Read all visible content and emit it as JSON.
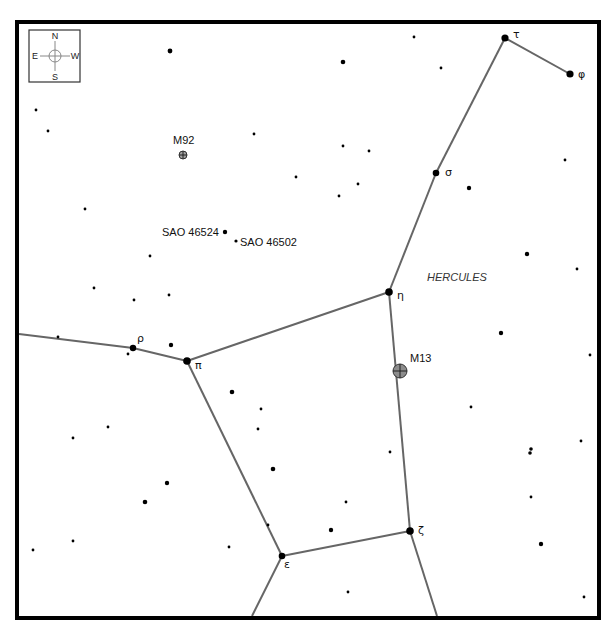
{
  "map": {
    "width": 612,
    "height": 632,
    "frame": {
      "x": 17,
      "y": 22,
      "w": 582,
      "h": 596
    },
    "constellation_name": {
      "text": "HERCULES",
      "x": 427,
      "y": 281
    },
    "compass": {
      "box": {
        "x": 29,
        "y": 30,
        "w": 51,
        "h": 52
      },
      "center": {
        "x": 55,
        "y": 56
      },
      "labels": {
        "north": "N",
        "south": "S",
        "east": "E",
        "west": "W"
      }
    },
    "colors": {
      "line": "#666666",
      "star": "#000000",
      "dso_m13": "#8c8c8c",
      "dso_m92": "#a0a0a0",
      "frame": "#000000"
    },
    "named_stars": [
      {
        "id": "tau",
        "label": "τ",
        "x": 505,
        "y": 38,
        "r": 3.6,
        "lx": 513,
        "ly": 38
      },
      {
        "id": "phi",
        "label": "φ",
        "x": 570,
        "y": 74,
        "r": 3.6,
        "lx": 578,
        "ly": 78
      },
      {
        "id": "sigma",
        "label": "σ",
        "x": 436,
        "y": 173,
        "r": 3.3,
        "lx": 445,
        "ly": 176
      },
      {
        "id": "eta",
        "label": "η",
        "x": 389,
        "y": 292,
        "r": 3.8,
        "lx": 397,
        "ly": 299
      },
      {
        "id": "pi",
        "label": "π",
        "x": 187,
        "y": 361,
        "r": 3.8,
        "lx": 195,
        "ly": 369
      },
      {
        "id": "rho",
        "label": "ρ",
        "x": 133,
        "y": 348,
        "r": 3.2,
        "lx": 137,
        "ly": 342
      },
      {
        "id": "epsilon",
        "label": "ε",
        "x": 282,
        "y": 556,
        "r": 3.3,
        "lx": 284,
        "ly": 568
      },
      {
        "id": "zeta",
        "label": "ζ",
        "x": 410,
        "y": 531,
        "r": 3.8,
        "lx": 418,
        "ly": 534
      }
    ],
    "labeled_stars": [
      {
        "label": "SAO 46524",
        "x": 225,
        "y": 232,
        "r": 2.2,
        "lx": 162,
        "ly": 236,
        "anchor": "start"
      },
      {
        "label": "SAO 46502",
        "x": 236,
        "y": 241,
        "r": 1.6,
        "lx": 240,
        "ly": 246,
        "anchor": "start"
      }
    ],
    "deep_sky_objects": [
      {
        "label": "M92",
        "x": 183,
        "y": 155,
        "r": 4,
        "fill": "#a0a0a0",
        "lx": 173,
        "ly": 144
      },
      {
        "label": "M13",
        "x": 400,
        "y": 371,
        "r": 7,
        "fill": "#8c8c8c",
        "lx": 410,
        "ly": 362
      }
    ],
    "lines": [
      {
        "from": "tau",
        "to": "phi",
        "x1": 505,
        "y1": 38,
        "x2": 570,
        "y2": 74
      },
      {
        "from": "tau",
        "to": "sigma",
        "x1": 505,
        "y1": 38,
        "x2": 436,
        "y2": 173
      },
      {
        "from": "sigma",
        "to": "eta",
        "x1": 436,
        "y1": 173,
        "x2": 389,
        "y2": 292
      },
      {
        "from": "eta",
        "to": "pi",
        "x1": 389,
        "y1": 292,
        "x2": 187,
        "y2": 361
      },
      {
        "from": "eta",
        "to": "zeta",
        "x1": 389,
        "y1": 292,
        "x2": 410,
        "y2": 531
      },
      {
        "from": "pi",
        "to": "rho",
        "x1": 187,
        "y1": 361,
        "x2": 133,
        "y2": 348
      },
      {
        "from": "rho",
        "to": "edge-left",
        "x1": 133,
        "y1": 348,
        "x2": 19,
        "y2": 334
      },
      {
        "from": "pi",
        "to": "epsilon",
        "x1": 187,
        "y1": 361,
        "x2": 282,
        "y2": 556
      },
      {
        "from": "epsilon",
        "to": "zeta",
        "x1": 282,
        "y1": 556,
        "x2": 410,
        "y2": 531
      },
      {
        "from": "epsilon",
        "to": "edge-bottom",
        "x1": 282,
        "y1": 556,
        "x2": 252,
        "y2": 616
      },
      {
        "from": "zeta",
        "to": "edge-bottom",
        "x1": 410,
        "y1": 531,
        "x2": 437,
        "y2": 616
      }
    ],
    "field_stars": [
      {
        "x": 170,
        "y": 51,
        "r": 2.4
      },
      {
        "x": 36,
        "y": 110,
        "r": 1.4
      },
      {
        "x": 48,
        "y": 131,
        "r": 1.4
      },
      {
        "x": 414,
        "y": 37,
        "r": 1.4
      },
      {
        "x": 343,
        "y": 62,
        "r": 2.3
      },
      {
        "x": 441,
        "y": 68,
        "r": 1.4
      },
      {
        "x": 254,
        "y": 134,
        "r": 1.4
      },
      {
        "x": 343,
        "y": 146,
        "r": 1.4
      },
      {
        "x": 369,
        "y": 151,
        "r": 1.4
      },
      {
        "x": 296,
        "y": 177,
        "r": 1.4
      },
      {
        "x": 358,
        "y": 184,
        "r": 1.4
      },
      {
        "x": 339,
        "y": 196,
        "r": 1.4
      },
      {
        "x": 565,
        "y": 160,
        "r": 1.4
      },
      {
        "x": 469,
        "y": 188,
        "r": 2.2
      },
      {
        "x": 527,
        "y": 254,
        "r": 2.2
      },
      {
        "x": 577,
        "y": 269,
        "r": 1.4
      },
      {
        "x": 85,
        "y": 209,
        "r": 1.4
      },
      {
        "x": 150,
        "y": 256,
        "r": 1.4
      },
      {
        "x": 94,
        "y": 288,
        "r": 1.4
      },
      {
        "x": 134,
        "y": 300,
        "r": 1.4
      },
      {
        "x": 169,
        "y": 295,
        "r": 1.4
      },
      {
        "x": 58,
        "y": 337,
        "r": 1.4
      },
      {
        "x": 171,
        "y": 345,
        "r": 2.2
      },
      {
        "x": 128,
        "y": 354,
        "r": 1.4
      },
      {
        "x": 501,
        "y": 333,
        "r": 2.2
      },
      {
        "x": 590,
        "y": 355,
        "r": 1.4
      },
      {
        "x": 471,
        "y": 407,
        "r": 1.4
      },
      {
        "x": 531,
        "y": 449,
        "r": 1.8
      },
      {
        "x": 530,
        "y": 453,
        "r": 1.8
      },
      {
        "x": 581,
        "y": 441,
        "r": 1.4
      },
      {
        "x": 531,
        "y": 497,
        "r": 1.4
      },
      {
        "x": 541,
        "y": 544,
        "r": 2.2
      },
      {
        "x": 584,
        "y": 597,
        "r": 1.4
      },
      {
        "x": 232,
        "y": 392,
        "r": 2.3
      },
      {
        "x": 261,
        "y": 409,
        "r": 1.4
      },
      {
        "x": 258,
        "y": 429,
        "r": 1.4
      },
      {
        "x": 108,
        "y": 427,
        "r": 1.4
      },
      {
        "x": 73,
        "y": 438,
        "r": 1.4
      },
      {
        "x": 273,
        "y": 469,
        "r": 2.3
      },
      {
        "x": 390,
        "y": 452,
        "r": 1.4
      },
      {
        "x": 167,
        "y": 483,
        "r": 2.2
      },
      {
        "x": 145,
        "y": 502,
        "r": 2.3
      },
      {
        "x": 346,
        "y": 502,
        "r": 1.4
      },
      {
        "x": 268,
        "y": 525,
        "r": 1.4
      },
      {
        "x": 331,
        "y": 530,
        "r": 2.2
      },
      {
        "x": 73,
        "y": 541,
        "r": 1.4
      },
      {
        "x": 33,
        "y": 550,
        "r": 1.4
      },
      {
        "x": 229,
        "y": 547,
        "r": 1.4
      },
      {
        "x": 348,
        "y": 592,
        "r": 1.4
      }
    ]
  }
}
